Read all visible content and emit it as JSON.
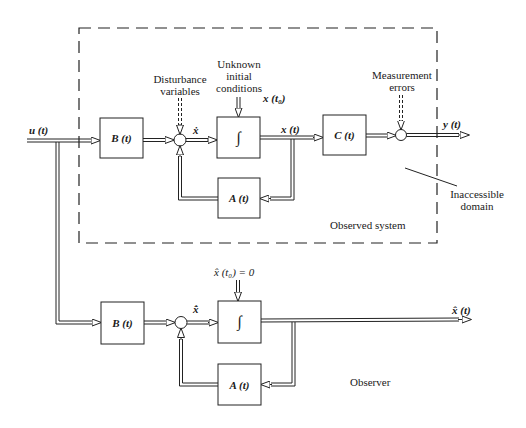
{
  "diagram": {
    "type": "block-diagram"
  },
  "observed_system": {
    "region_label": "Observed system",
    "inaccessible_label_line1": "Inaccessible",
    "inaccessible_label_line2": "domain",
    "input_label": "u (t)",
    "disturbance_line1": "Disturbance",
    "disturbance_line2": "variables",
    "unknown_ic_line1": "Unknown",
    "unknown_ic_line2": "initial",
    "unknown_ic_line3": "conditions",
    "x0_label": "x (t₀)",
    "xdot_label": "ẋ",
    "state_label": "x (t)",
    "measurement_line1": "Measurement",
    "measurement_line2": "errors",
    "output_label": "y (t)",
    "blocks": {
      "B": "B (t)",
      "integrator": "∫",
      "C": "C (t)",
      "A": "A (t)"
    }
  },
  "observer": {
    "region_label": "Observer",
    "initial_condition": "x̂ (t₀) = 0",
    "xhatdot_label": "x̂̇",
    "output_label": "x̂ (t)",
    "blocks": {
      "B": "B (t)",
      "integrator": "∫",
      "A": "A (t)"
    }
  }
}
